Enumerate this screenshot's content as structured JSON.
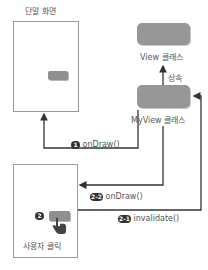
{
  "device_top": {
    "title": "단말 화면"
  },
  "device_bottom": {
    "caption": "사용자 클릭",
    "step_badge": "2"
  },
  "classes": {
    "view": {
      "label": "View 클래스"
    },
    "myview": {
      "label": "MyView 클래스"
    },
    "inheritance_label": "상속"
  },
  "arrows": {
    "step1": {
      "badge": "1",
      "label": "onDraw()"
    },
    "step2_2": {
      "badge": "2-2",
      "label": "onDraw()"
    },
    "step2_1": {
      "badge": "2-1",
      "label": "invalidate()"
    }
  },
  "colors": {
    "box_fill": "#979797",
    "line": "#333333",
    "device_border": "#9a9a9a"
  }
}
